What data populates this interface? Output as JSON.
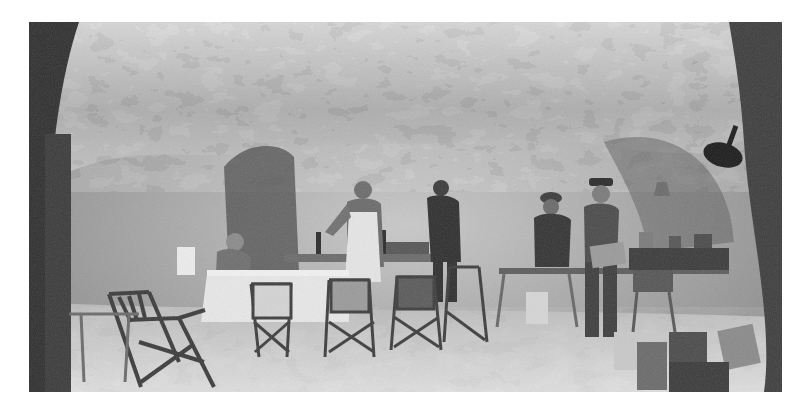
{
  "image": {
    "type": "black-and-white photograph",
    "description": "Interior of a rock-cut cave used as a mess room, with men in uniform standing and seated among folding chairs and tables",
    "palette": {
      "paper": "#ffffff",
      "rock_light": "#d9d9d9",
      "rock_mid": "#a6a6a6",
      "rock_dark": "#3a3a3a",
      "shadow": "#1c1c1c",
      "floor": "#cfcfcf"
    },
    "frame": {
      "x": 29,
      "y": 22,
      "width": 753,
      "height": 370
    }
  },
  "scene": {
    "figures": [
      {
        "id": "seated-man",
        "pose": "seated at table, leaning forward, reading"
      },
      {
        "id": "man-in-apron",
        "pose": "standing, wearing white apron, pouring from bottle"
      },
      {
        "id": "man-in-tunic",
        "pose": "standing behind table, dark tunic"
      },
      {
        "id": "man-in-helmet",
        "pose": "standing at side table, wearing helmet"
      },
      {
        "id": "man-in-cap",
        "pose": "standing, wearing peaked cap, holding a box"
      }
    ],
    "objects": [
      "folding camp chairs",
      "bentwood chair in foreground",
      "long table with white cloth",
      "trestle side table with tins",
      "bottles",
      "hanging lamp on right wall",
      "metal lantern",
      "crates and ration tins on floor"
    ]
  }
}
